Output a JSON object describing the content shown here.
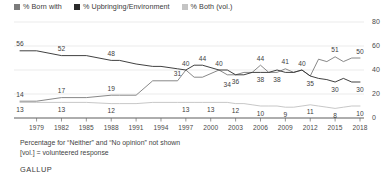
{
  "legend": {
    "items": [
      {
        "label": "% Born with",
        "color": "#7b7b7b",
        "icon": "square-swatch"
      },
      {
        "label": "% Upbringing/Environment",
        "color": "#2b2b2b",
        "icon": "square-swatch"
      },
      {
        "label": "% Both (vol.)",
        "color": "#c4c4c4",
        "icon": "square-swatch"
      }
    ]
  },
  "footnote": {
    "line1": "Percentage for “Neither” and “No opinion” not shown",
    "line2": "[vol.] = volunteered response"
  },
  "source": {
    "name": "GALLUP"
  },
  "chart_data": {
    "type": "line",
    "title": "",
    "xlabel": "",
    "ylabel": "",
    "ylim": [
      0,
      80
    ],
    "yticks": [
      0,
      20,
      40,
      60,
      80
    ],
    "ytick_labels": [
      "0",
      "20",
      "40",
      "60",
      "80"
    ],
    "grid": true,
    "legend_position": "top-left",
    "xlim": [
      1977,
      2018
    ],
    "xtick_labels": [
      "1979",
      "1982",
      "1985",
      "1988",
      "1991",
      "1994",
      "1997",
      "2000",
      "2003",
      "2006",
      "2009",
      "2012",
      "2015",
      "2018"
    ],
    "xticks": [
      1979,
      1982,
      1985,
      1988,
      1991,
      1994,
      1997,
      2000,
      2003,
      2006,
      2009,
      2012,
      2015,
      2018
    ],
    "x": [
      1977,
      1979,
      1982,
      1985,
      1988,
      1989,
      1991,
      1993,
      1994,
      1996,
      1997,
      1998,
      1999,
      2001,
      2002,
      2003,
      2004,
      2005,
      2006,
      2007,
      2008,
      2009,
      2010,
      2011,
      2012,
      2013,
      2014,
      2015,
      2016,
      2017,
      2018
    ],
    "series": [
      {
        "name": "% Born with",
        "color": "#7b7b7b",
        "values": [
          14,
          14,
          17,
          17,
          19,
          19,
          19,
          31,
          31,
          31,
          40,
          34,
          34,
          40,
          36,
          36,
          38,
          38,
          44,
          38,
          38,
          41,
          38,
          40,
          35,
          49,
          47,
          51,
          47,
          50,
          50
        ],
        "labels": [
          {
            "x": 1977,
            "value": 14,
            "text": "14",
            "pos": "above"
          },
          {
            "x": 1982,
            "value": 17,
            "text": "17",
            "pos": "above"
          },
          {
            "x": 1988,
            "value": 19,
            "text": "19",
            "pos": "above"
          },
          {
            "x": 1996,
            "value": 31,
            "text": "31",
            "pos": "above"
          },
          {
            "x": 2001,
            "value": 40,
            "text": "40",
            "pos": "above"
          },
          {
            "x": 2006,
            "value": 44,
            "text": "44",
            "pos": "above"
          },
          {
            "x": 2009,
            "value": 41,
            "text": "41",
            "pos": "above"
          },
          {
            "x": 2011,
            "value": 40,
            "text": "40",
            "pos": "above"
          },
          {
            "x": 2015,
            "value": 51,
            "text": "51",
            "pos": "above"
          },
          {
            "x": 2018,
            "value": 50,
            "text": "50",
            "pos": "above"
          }
        ]
      },
      {
        "name": "% Upbringing/Environment",
        "color": "#2b2b2b",
        "values": [
          56,
          56,
          52,
          52,
          48,
          48,
          45,
          43,
          43,
          41,
          40,
          44,
          44,
          40,
          40,
          36,
          36,
          38,
          38,
          38,
          40,
          38,
          38,
          40,
          35,
          33,
          32,
          30,
          33,
          30,
          30
        ],
        "labels": [
          {
            "x": 1977,
            "value": 56,
            "text": "56",
            "pos": "above"
          },
          {
            "x": 1982,
            "value": 52,
            "text": "52",
            "pos": "above"
          },
          {
            "x": 1988,
            "value": 48,
            "text": "48",
            "pos": "above"
          },
          {
            "x": 1997,
            "value": 40,
            "text": "40",
            "pos": "above"
          },
          {
            "x": 1999,
            "value": 44,
            "text": "44",
            "pos": "above"
          },
          {
            "x": 2003,
            "value": 36,
            "text": "36",
            "pos": "below"
          },
          {
            "x": 2006,
            "value": 38,
            "text": "38",
            "pos": "below"
          },
          {
            "x": 2008,
            "value": 38,
            "text": "38",
            "pos": "below"
          },
          {
            "x": 2002,
            "value": 34,
            "text": "34",
            "pos": "below"
          },
          {
            "x": 2012,
            "value": 35,
            "text": "35",
            "pos": "below"
          },
          {
            "x": 2015,
            "value": 30,
            "text": "30",
            "pos": "below"
          },
          {
            "x": 2018,
            "value": 30,
            "text": "30",
            "pos": "below"
          }
        ]
      },
      {
        "name": "% Both (vol.)",
        "color": "#b9b9b9",
        "values": [
          13,
          13,
          13,
          13,
          12,
          12,
          12,
          13,
          13,
          13,
          13,
          13,
          13,
          13,
          13,
          12,
          12,
          11,
          10,
          10,
          10,
          9,
          9,
          10,
          11,
          10,
          9,
          8,
          9,
          10,
          10
        ],
        "labels": [
          {
            "x": 1977,
            "value": 13,
            "text": "13",
            "pos": "below"
          },
          {
            "x": 1982,
            "value": 13,
            "text": "13",
            "pos": "below"
          },
          {
            "x": 1988,
            "value": 12,
            "text": "12",
            "pos": "below"
          },
          {
            "x": 1997,
            "value": 13,
            "text": "13",
            "pos": "below"
          },
          {
            "x": 2000,
            "value": 13,
            "text": "13",
            "pos": "below"
          },
          {
            "x": 2003,
            "value": 12,
            "text": "12",
            "pos": "below"
          },
          {
            "x": 2006,
            "value": 10,
            "text": "10",
            "pos": "below"
          },
          {
            "x": 2009,
            "value": 9,
            "text": "9",
            "pos": "below"
          },
          {
            "x": 2012,
            "value": 11,
            "text": "11",
            "pos": "below"
          },
          {
            "x": 2015,
            "value": 8,
            "text": "8",
            "pos": "below"
          },
          {
            "x": 2018,
            "value": 10,
            "text": "10",
            "pos": "below"
          }
        ]
      }
    ]
  }
}
